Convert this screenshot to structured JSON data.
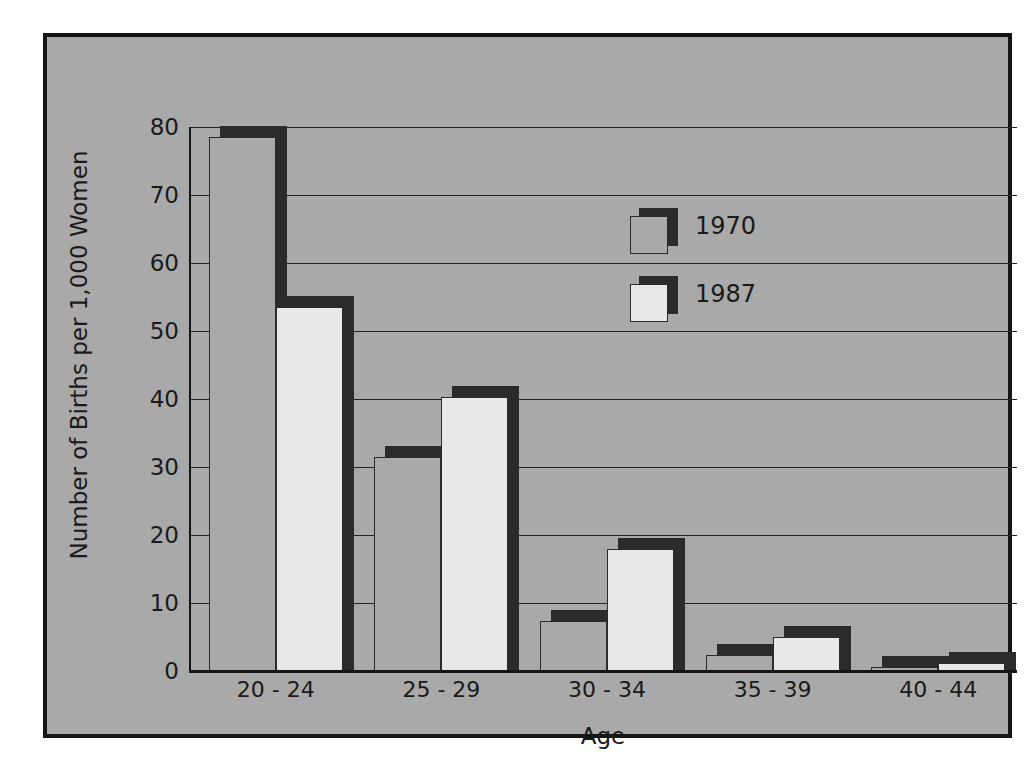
{
  "chart_data": {
    "type": "bar",
    "title": "",
    "xlabel": "Age",
    "ylabel": "Number of Births per 1,000 Women",
    "categories": [
      "20 - 24",
      "25 - 29",
      "30 - 34",
      "35 - 39",
      "40 - 44"
    ],
    "series": [
      {
        "name": "1970",
        "values": [
          78.5,
          31.5,
          7.3,
          2.3,
          0.6
        ]
      },
      {
        "name": "1987",
        "values": [
          53.5,
          40.3,
          18.0,
          5.0,
          1.2
        ]
      }
    ],
    "ylim": [
      0,
      80
    ],
    "yticks": [
      0,
      10,
      20,
      30,
      40,
      50,
      60,
      70,
      80
    ],
    "ytick_labels": [
      "0",
      "10",
      "20",
      "30",
      "40",
      "50",
      "60",
      "70",
      "80"
    ],
    "grid": true,
    "legend_position": "upper right inside",
    "colors": {
      "panel_background": "#a9a9a9",
      "frame": "#141414",
      "series_1970_fill": "#a9a9a9",
      "series_1987_fill": "#e8e8e8",
      "bar_outline": "#2b2b2b",
      "bar_shadow": "#2b2b2b",
      "gridline": "#232323",
      "text": "#1a1a1a",
      "page_background": "#ffffff"
    }
  }
}
